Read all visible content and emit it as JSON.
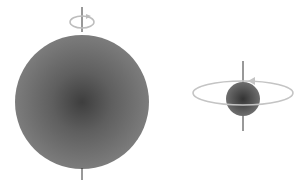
{
  "diagram": {
    "colors": {
      "background": "#ffffff",
      "sphere_edge": "#7a7a7a",
      "sphere_center": "#3e3e3e",
      "axis": "#333333",
      "rotation_arrow": "#bdbdbd"
    },
    "objects": [
      {
        "name": "large-sphere",
        "label": ""
      },
      {
        "name": "small-sphere",
        "label": ""
      }
    ]
  }
}
